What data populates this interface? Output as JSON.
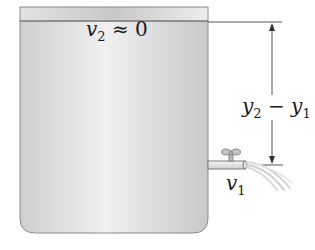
{
  "diagram": {
    "labels": {
      "surface_velocity": {
        "var": "v",
        "sub": "2",
        "rest": " ≈ 0"
      },
      "outlet_velocity": {
        "var": "v",
        "sub": "1"
      },
      "height_difference": {
        "var_a": "y",
        "sub_a": "2",
        "op": " − ",
        "var_b": "y",
        "sub_b": "1"
      }
    },
    "colors": {
      "liquid": "#d4d4d4",
      "liquid_highlight": "#efefef",
      "air_gap": "#ececec",
      "outline": "#8a8a8a",
      "dimension_line": "#555555",
      "text": "#1a1a1a"
    }
  }
}
